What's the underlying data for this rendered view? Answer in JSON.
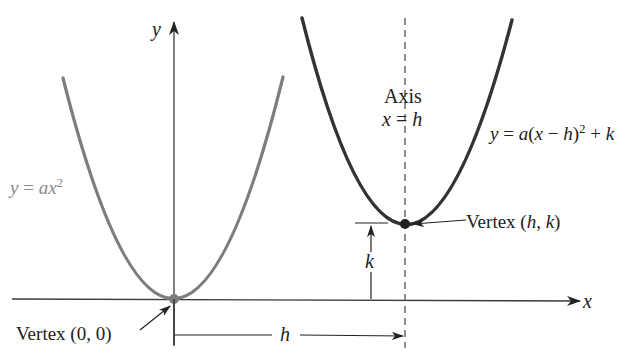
{
  "diagram": {
    "colors": {
      "base_parabola": "#7d7d7d",
      "shifted_parabola": "#333333",
      "axes": "#3a3a3a",
      "text": "#222222",
      "base_label": "#8a8a8a"
    },
    "axes": {
      "x_label": "x",
      "y_label": "y"
    },
    "curves": [
      {
        "name": "base-parabola",
        "equation_prefix": "y = a",
        "equation_var": "x",
        "equation_exp": "2",
        "vertex_label": "Vertex (0, 0)"
      },
      {
        "name": "shifted-parabola",
        "equation": "y = a(x − h)² + k",
        "vertex_label_prefix": "Vertex (",
        "vertex_h": "h",
        "vertex_sep": ", ",
        "vertex_k": "k",
        "vertex_label_suffix": ")"
      }
    ],
    "labels": {
      "axis_of_symmetry_line1": "Axis",
      "axis_of_symmetry_line2_var": "x",
      "axis_of_symmetry_line2_eq": " = ",
      "axis_of_symmetry_line2_val": "h",
      "base_eq_y": "y",
      "base_eq_eq": " = ",
      "base_eq_a": "ax",
      "base_eq_exp": "2",
      "shifted_eq_y": "y",
      "shifted_eq_rest1": " = ",
      "shifted_eq_a": "a",
      "shifted_eq_paren_open": "(",
      "shifted_eq_x": "x",
      "shifted_eq_minus": " − ",
      "shifted_eq_h": "h",
      "shifted_eq_paren_close": ")",
      "shifted_eq_exp": "2",
      "shifted_eq_plus": " + ",
      "shifted_eq_k": "k",
      "vertex_origin": "Vertex (0, 0)",
      "vertex_hk_prefix": "Vertex (",
      "vertex_hk_h": "h",
      "vertex_hk_sep": ", ",
      "vertex_hk_k": "k",
      "vertex_hk_suffix": ")",
      "horizontal_shift": "h",
      "vertical_shift": "k"
    }
  }
}
